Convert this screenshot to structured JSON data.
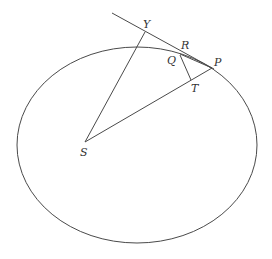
{
  "diagram": {
    "type": "geometry",
    "colors": {
      "stroke": "#4a4a4a",
      "label": "#333333",
      "background": "#ffffff"
    },
    "ellipse": {
      "cx": 137,
      "cy": 145,
      "rx": 120,
      "ry": 98
    },
    "points": {
      "S": {
        "x": 85,
        "y": 142,
        "label": "S"
      },
      "P": {
        "x": 212,
        "y": 68,
        "label": "P"
      },
      "Y": {
        "x": 145,
        "y": 32,
        "label": "Y"
      },
      "R": {
        "x": 180,
        "y": 52,
        "label": "R"
      },
      "Q": {
        "x": 180,
        "y": 55,
        "label": "Q"
      },
      "T": {
        "x": 191,
        "y": 80,
        "label": "T"
      }
    },
    "segments": [
      {
        "name": "tangent-line",
        "from": [
          112,
          13
        ],
        "to": [
          214,
          69
        ]
      },
      {
        "name": "segment-SY",
        "from": "S",
        "to": "Y"
      },
      {
        "name": "segment-SP",
        "from": "S",
        "to": "P"
      },
      {
        "name": "segment-QT",
        "from": "Q",
        "to": "T"
      },
      {
        "name": "segment-QP",
        "from": "Q",
        "to": "P"
      }
    ],
    "labels": {
      "S": "S",
      "P": "P",
      "Y": "Y",
      "R": "R",
      "Q": "Q",
      "T": "T"
    }
  }
}
